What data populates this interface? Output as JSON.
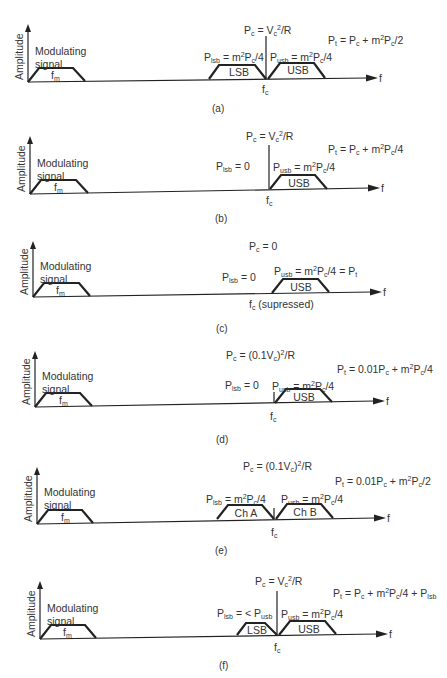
{
  "figure": {
    "axis_label_y": "Amplitude",
    "axis_label_x": "f",
    "modulating_line1": "Modulating",
    "modulating_line2": "signal",
    "fm_label": "f",
    "fm_sub": "m",
    "fc_label": "f",
    "fc_sub": "c"
  },
  "panels": [
    {
      "caption": "(a)",
      "pc": "P_c = V_c^2/R",
      "pt": "P_t = P_c + m^2P_c/2",
      "plsb": "P_lsb = m^2P_c/4",
      "pusb": "P_usb = m^2P_c/4",
      "lower_box": "LSB",
      "upper_box": "USB"
    },
    {
      "caption": "(b)",
      "pc": "P_c = V_c^2/R",
      "pt": "P_t = P_c + m^2P_c/4",
      "plsb": "P_lsb = 0",
      "pusb": "P_usb = m^2P_c/4",
      "upper_box": "USB"
    },
    {
      "caption": "(c)",
      "pc": "P_c = 0",
      "plsb": "P_lsb = 0",
      "pusb": "P_usb = m^2P_c/4 = P_t",
      "upper_box": "USB",
      "fc_note": "(supressed)"
    },
    {
      "caption": "(d)",
      "pc": "P_c = (0.1V_c)^2/R",
      "pt": "P_t = 0.01P_c + m^2P_c/4",
      "plsb": "P_lsb = 0",
      "pusb": "P_usb = m^2P_c/4",
      "upper_box": "USB"
    },
    {
      "caption": "(e)",
      "pc": "P_c = (0.1V_c)^2/R",
      "pt": "P_t = 0.01P_c + m^2P_c/2",
      "plsb": "P_lsb = m^2P_c/4",
      "pusb": "P_usb = m^2P_c/4",
      "lower_box": "Ch A",
      "upper_box": "Ch B"
    },
    {
      "caption": "(f)",
      "pc": "P_c = V_c^2/R",
      "pt": "P_t = P_c + m^2P_c/4 + P_lsb",
      "plsb": "P_lsb = < P_usb",
      "pusb": "P_usb = m^2P_c/4",
      "lower_box": "LSB",
      "upper_box": "USB"
    }
  ]
}
